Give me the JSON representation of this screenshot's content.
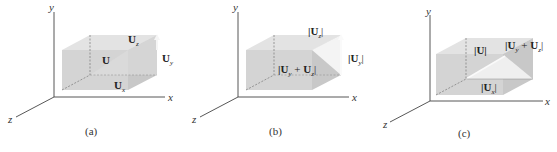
{
  "figure": {
    "colors": {
      "box_front": "#d2d2d2",
      "box_top": "#e3e3e3",
      "box_side": "#c6c6c6",
      "axis": "#444444",
      "arrow": "#f2f2f2"
    },
    "panels": [
      {
        "caption": "(a)",
        "axes": {
          "x": "x",
          "y": "y",
          "z": "z"
        },
        "labels": {
          "U": "U",
          "Ux": "U",
          "Ux_sub": "x",
          "Uy": "U",
          "Uy_sub": "y",
          "Uz": "U",
          "Uz_sub": "z"
        }
      },
      {
        "caption": "(b)",
        "axes": {
          "x": "x",
          "y": "y",
          "z": "z"
        },
        "labels": {
          "Uz": "|U",
          "Uz_sub": "z",
          "Uz_close": "|",
          "Uy": "|U",
          "Uy_sub": "y",
          "Uy_close": "|",
          "sum_a": "|U",
          "sum_a_sub": "y",
          "sum_plus": " + ",
          "sum_b": "U",
          "sum_b_sub": "z",
          "sum_close": "|"
        }
      },
      {
        "caption": "(c)",
        "axes": {
          "x": "x",
          "y": "y",
          "z": "z"
        },
        "labels": {
          "U": "|U|",
          "Ux": "|U",
          "Ux_sub": "x",
          "Ux_close": "|",
          "sum_a": "|U",
          "sum_a_sub": "y",
          "sum_plus": " + ",
          "sum_b": "U",
          "sum_b_sub": "z",
          "sum_close": "|"
        }
      }
    ]
  }
}
